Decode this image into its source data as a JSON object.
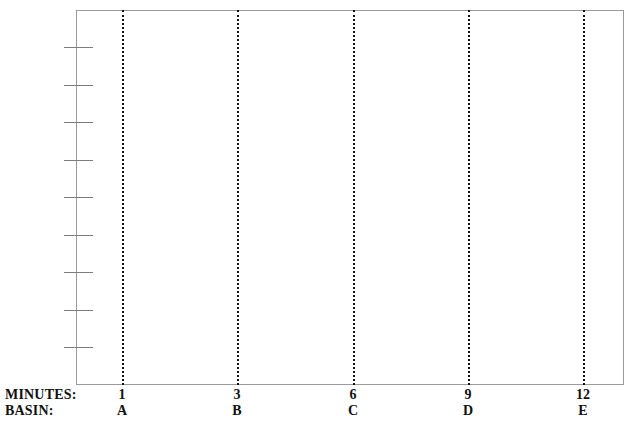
{
  "chart_data": {
    "type": "line",
    "title": "",
    "subtitle": "",
    "xlabel": "",
    "ylabel": "",
    "grid": {
      "vertical_dotted": true,
      "horizontal": false
    },
    "legend": null,
    "annotations": [],
    "series": [],
    "note": "Empty plot frame: axes, tick marks and gridlines drawn, no data plotted",
    "x_axis": {
      "row_labels": [
        "MINUTES:",
        "BASIN:"
      ],
      "categories": [
        {
          "minutes": "1",
          "basin": "A",
          "x_px": 122
        },
        {
          "minutes": "3",
          "basin": "B",
          "x_px": 237
        },
        {
          "minutes": "6",
          "basin": "C",
          "x_px": 353
        },
        {
          "minutes": "9",
          "basin": "D",
          "x_px": 468
        },
        {
          "minutes": "12",
          "basin": "E",
          "x_px": 583
        }
      ],
      "minutes_values": [
        1,
        3,
        6,
        9,
        12
      ],
      "basin_values": [
        "A",
        "B",
        "C",
        "D",
        "E"
      ]
    },
    "y_axis": {
      "tick_labels": [],
      "tick_count": 10,
      "tick_positions_px": [
        47,
        85,
        122,
        160,
        197,
        235,
        272,
        310,
        347,
        385
      ]
    },
    "plot_area_px": {
      "left": 76,
      "top": 10,
      "right": 624,
      "bottom": 385
    },
    "colors": {
      "background": "#ffffff",
      "frame": "#9a9a9a",
      "tick": "#7d7d7d",
      "gridline": "#121212",
      "text": "#111111"
    }
  },
  "axis": {
    "row_minutes_label": "MINUTES:",
    "row_basin_label": "BASIN:"
  }
}
